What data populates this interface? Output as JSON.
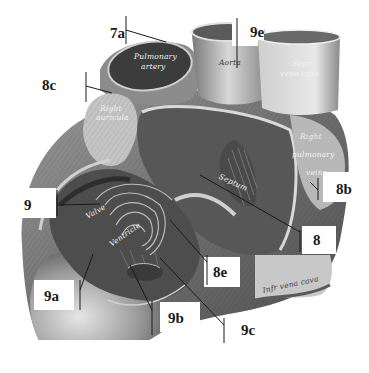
{
  "figure": {
    "style": "grayscale engraving",
    "colors": {
      "background": "#ffffff",
      "ink": "#1a1a1a",
      "dark_tissue": "#4a4a4a",
      "mid_tissue": "#8a8a8a",
      "light_tissue": "#d6d6d6"
    }
  },
  "callouts": [
    {
      "id": "7a",
      "label": "7a",
      "x": 117,
      "y": 27
    },
    {
      "id": "9e",
      "label": "9e",
      "x": 243,
      "y": 27
    },
    {
      "id": "8c",
      "label": "8c",
      "x": 45,
      "y": 80
    },
    {
      "id": "9",
      "label": "9",
      "x": 24,
      "y": 200
    },
    {
      "id": "8b",
      "label": "8b",
      "x": 334,
      "y": 184
    },
    {
      "id": "8",
      "label": "8",
      "x": 315,
      "y": 236
    },
    {
      "id": "8e",
      "label": "8e",
      "x": 216,
      "y": 269
    },
    {
      "id": "9a",
      "label": "9a",
      "x": 46,
      "y": 291
    },
    {
      "id": "9b",
      "label": "9b",
      "x": 166,
      "y": 313
    },
    {
      "id": "9c",
      "label": "9c",
      "x": 241,
      "y": 326
    }
  ],
  "engraved_labels": {
    "pulmonary_artery": [
      "Pulmonary",
      "artery"
    ],
    "aorta": "Aorta",
    "superior_vena_cava": [
      "Supr",
      "vena cava"
    ],
    "right_auricula": [
      "Right",
      "auricula"
    ],
    "right_pulmonary_veins": [
      "Right",
      "pulmonary",
      "veins"
    ],
    "septum": "Septum",
    "valve": "Valve",
    "ventricle": "Ventricle",
    "inferior_vena_cava": "Infr vena cava"
  }
}
